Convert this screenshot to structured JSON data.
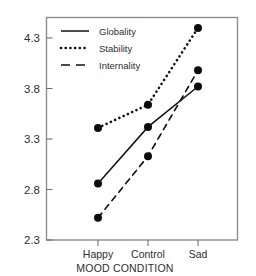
{
  "chart_data": {
    "type": "line",
    "title": "",
    "xlabel": "MOOD CONDITION",
    "ylabel": "",
    "categories": [
      "Happy",
      "Control",
      "Sad"
    ],
    "ylim": [
      2.3,
      4.55
    ],
    "yticks": [
      2.3,
      2.8,
      3.3,
      3.8,
      4.3
    ],
    "ytick_labels": [
      "2.3",
      "2.8",
      "3.3",
      "3.8",
      "4.3"
    ],
    "grid": false,
    "legend_position": "top-left inside",
    "series": [
      {
        "name": "Globality",
        "style": "solid",
        "marker": "filled-circle",
        "values": [
          2.86,
          3.42,
          3.82
        ]
      },
      {
        "name": "Stability",
        "style": "dotted",
        "marker": "filled-circle",
        "values": [
          3.41,
          3.64,
          4.4
        ]
      },
      {
        "name": "Internality",
        "style": "dashed",
        "marker": "filled-circle",
        "values": [
          2.52,
          3.13,
          3.98
        ]
      }
    ],
    "colors": {
      "line": "#111111",
      "marker": "#0c0c0c",
      "frame": "#8e8e8e",
      "text": "#2e2e2d",
      "background": "#ffffff"
    }
  },
  "axis": {
    "y_tick_labels": [
      "4.3",
      "3.8",
      "3.3",
      "2.8",
      "2.3"
    ],
    "x_tick_labels": [
      "Happy",
      "Control",
      "Sad"
    ],
    "x_title": "MOOD CONDITION"
  },
  "legend": {
    "entries": [
      {
        "label": "Globality",
        "style": "solid"
      },
      {
        "label": "Stability",
        "style": "dotted"
      },
      {
        "label": "Internality",
        "style": "dashed"
      }
    ]
  }
}
